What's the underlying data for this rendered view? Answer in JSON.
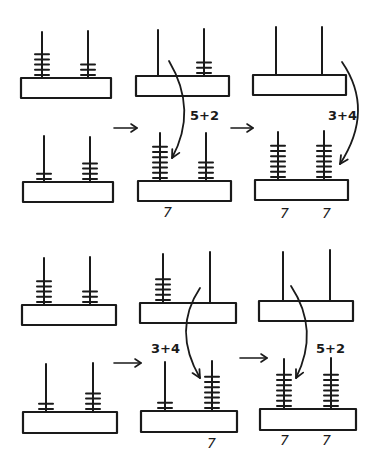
{
  "diagram": {
    "ink_color": "#1a1a1a",
    "background": "#ffffff"
  },
  "sequences": [
    {
      "name": "sequence-tens-first",
      "frames": [
        {
          "abaci": [
            {
              "x": 21,
              "y": 78,
              "w": 90,
              "h": 20,
              "rods": [
                {
                  "x": 42,
                  "top": 32,
                  "beads": 5
                },
                {
                  "x": 88,
                  "top": 31,
                  "beads": 3
                }
              ]
            },
            {
              "x": 23,
              "y": 182,
              "w": 90,
              "h": 20,
              "rods": [
                {
                  "x": 44,
                  "top": 136,
                  "beads": 2
                },
                {
                  "x": 90,
                  "top": 137,
                  "beads": 4
                }
              ]
            }
          ],
          "labels": []
        },
        {
          "abaci": [
            {
              "x": 136,
              "y": 76,
              "w": 93,
              "h": 20,
              "rods": [
                {
                  "x": 158,
                  "top": 30,
                  "beads": 0
                },
                {
                  "x": 204,
                  "top": 29,
                  "beads": 3
                }
              ]
            },
            {
              "x": 138,
              "y": 181,
              "w": 93,
              "h": 20,
              "rods": [
                {
                  "x": 160,
                  "top": 133,
                  "beads": 7
                },
                {
                  "x": 206,
                  "top": 133,
                  "beads": 4
                }
              ]
            }
          ],
          "labels": [
            {
              "text": "7",
              "x": 163,
              "y": 217
            }
          ],
          "curve": {
            "from": [
              169,
              61
            ],
            "ctrl": [
              198,
              110
            ],
            "to": [
              172,
              158
            ]
          },
          "equation": {
            "text": "5+2",
            "x": 190,
            "y": 120
          }
        },
        {
          "abaci": [
            {
              "x": 253,
              "y": 75,
              "w": 93,
              "h": 20,
              "rods": [
                {
                  "x": 276,
                  "top": 27,
                  "beads": 0
                },
                {
                  "x": 322,
                  "top": 27,
                  "beads": 0
                }
              ]
            },
            {
              "x": 255,
              "y": 180,
              "w": 93,
              "h": 20,
              "rods": [
                {
                  "x": 278,
                  "top": 132,
                  "beads": 7
                },
                {
                  "x": 324,
                  "top": 131,
                  "beads": 7
                }
              ]
            }
          ],
          "labels": [
            {
              "text": "7",
              "x": 280,
              "y": 218
            },
            {
              "text": "7",
              "x": 322,
              "y": 218
            }
          ],
          "curve": {
            "from": [
              342,
              62
            ],
            "ctrl": [
              375,
              110
            ],
            "to": [
              340,
              164
            ]
          },
          "equation": {
            "text": "3+4",
            "x": 328,
            "y": 120
          }
        }
      ],
      "arrows": [
        {
          "x1": 114,
          "y1": 128,
          "x2": 137,
          "y2": 128
        },
        {
          "x1": 231,
          "y1": 128,
          "x2": 253,
          "y2": 128
        }
      ]
    },
    {
      "name": "sequence-ones-first",
      "frames": [
        {
          "abaci": [
            {
              "x": 22,
              "y": 305,
              "w": 94,
              "h": 20,
              "rods": [
                {
                  "x": 44,
                  "top": 258,
                  "beads": 5
                },
                {
                  "x": 90,
                  "top": 257,
                  "beads": 3
                }
              ]
            },
            {
              "x": 23,
              "y": 412,
              "w": 94,
              "h": 21,
              "rods": [
                {
                  "x": 46,
                  "top": 364,
                  "beads": 2
                },
                {
                  "x": 93,
                  "top": 363,
                  "beads": 4
                }
              ]
            }
          ],
          "labels": []
        },
        {
          "abaci": [
            {
              "x": 140,
              "y": 303,
              "w": 96,
              "h": 20,
              "rods": [
                {
                  "x": 163,
                  "top": 254,
                  "beads": 5
                },
                {
                  "x": 210,
                  "top": 252,
                  "beads": 0
                }
              ]
            },
            {
              "x": 141,
              "y": 411,
              "w": 96,
              "h": 21,
              "rods": [
                {
                  "x": 165,
                  "top": 362,
                  "beads": 2
                },
                {
                  "x": 212,
                  "top": 361,
                  "beads": 7
                }
              ]
            }
          ],
          "labels": [
            {
              "text": "7",
              "x": 207,
              "y": 448
            }
          ],
          "curve": {
            "from": [
              200,
              288
            ],
            "ctrl": [
              172,
              330
            ],
            "to": [
              200,
              378
            ]
          },
          "equation": {
            "text": "3+4",
            "x": 151,
            "y": 353
          }
        },
        {
          "abaci": [
            {
              "x": 259,
              "y": 301,
              "w": 94,
              "h": 20,
              "rods": [
                {
                  "x": 283,
                  "top": 252,
                  "beads": 0
                },
                {
                  "x": 330,
                  "top": 250,
                  "beads": 0
                }
              ]
            },
            {
              "x": 260,
              "y": 409,
              "w": 96,
              "h": 21,
              "rods": [
                {
                  "x": 284,
                  "top": 359,
                  "beads": 7
                },
                {
                  "x": 331,
                  "top": 358,
                  "beads": 7
                }
              ]
            }
          ],
          "labels": [
            {
              "text": "7",
              "x": 280,
              "y": 445
            },
            {
              "text": "7",
              "x": 322,
              "y": 445
            }
          ],
          "curve": {
            "from": [
              291,
              286
            ],
            "ctrl": [
              320,
              330
            ],
            "to": [
              296,
              378
            ]
          },
          "equation": {
            "text": "5+2",
            "x": 316,
            "y": 353
          }
        }
      ],
      "arrows": [
        {
          "x1": 114,
          "y1": 363,
          "x2": 141,
          "y2": 363
        },
        {
          "x1": 240,
          "y1": 358,
          "x2": 267,
          "y2": 358
        }
      ]
    }
  ]
}
